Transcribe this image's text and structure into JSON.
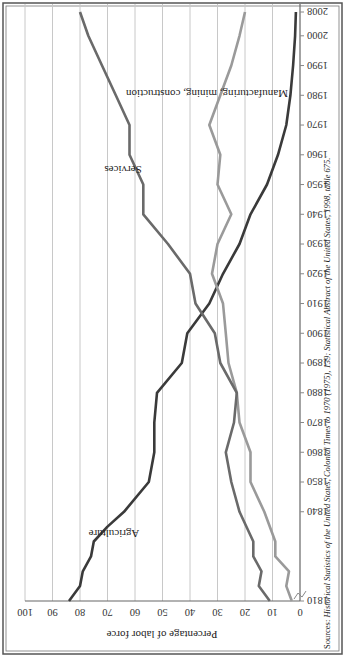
{
  "chart_data": {
    "type": "line",
    "title": "",
    "xlabel": "",
    "ylabel": "Percentage of labor force",
    "ylim": [
      0,
      100
    ],
    "grid": true,
    "y_ticks": [
      "0",
      "10",
      "20",
      "30",
      "40",
      "50",
      "60",
      "70",
      "80",
      "90",
      "100"
    ],
    "x_ticks": [
      "1810",
      "1840",
      "1850",
      "1860",
      "1870",
      "1880",
      "1890",
      "1900",
      "1910",
      "1920",
      "1930",
      "1940",
      "1950",
      "1960",
      "1970",
      "1980",
      "1990",
      "2000",
      "2008"
    ],
    "series": [
      {
        "name": "Agriculture",
        "color": "#3a3a3a",
        "x": [
          1810,
          1815,
          1820,
          1825,
          1830,
          1835,
          1840,
          1850,
          1860,
          1870,
          1880,
          1890,
          1900,
          1910,
          1920,
          1930,
          1940,
          1950,
          1960,
          1970,
          1980,
          1990,
          2000,
          2008
        ],
        "values": [
          84,
          80,
          79,
          76,
          75,
          70,
          64,
          55,
          53,
          53,
          52,
          43,
          41,
          33,
          28,
          22,
          18,
          12,
          8,
          5,
          3.5,
          2.5,
          1.8,
          1.5
        ]
      },
      {
        "name": "Manufacturing, mining, construction",
        "color": "#9a9a9a",
        "x": [
          1810,
          1815,
          1820,
          1825,
          1830,
          1840,
          1850,
          1860,
          1870,
          1880,
          1890,
          1900,
          1910,
          1920,
          1930,
          1940,
          1950,
          1960,
          1970,
          1980,
          1990,
          2000,
          2008
        ],
        "values": [
          3,
          5,
          4,
          9,
          9,
          13,
          18,
          18,
          22,
          23,
          26,
          27,
          28,
          32,
          30,
          25,
          30,
          29,
          33,
          29,
          25,
          22,
          20
        ]
      },
      {
        "name": "Services",
        "color": "#6a6a6a",
        "x": [
          1810,
          1815,
          1820,
          1825,
          1830,
          1840,
          1850,
          1860,
          1870,
          1880,
          1890,
          1900,
          1910,
          1920,
          1930,
          1940,
          1950,
          1960,
          1970,
          1980,
          1990,
          2000,
          2008
        ],
        "values": [
          11,
          15,
          14,
          17,
          17,
          22,
          25,
          27,
          24,
          23,
          29,
          31,
          38,
          40,
          48,
          57,
          57,
          62,
          62,
          67,
          72,
          77,
          80
        ]
      }
    ],
    "annotations": [
      {
        "text": "Agriculture",
        "near": "1845"
      },
      {
        "text": "Services",
        "near": "1965"
      },
      {
        "text": "Manufacturing, mining, construction",
        "near": "1960"
      }
    ],
    "source": "Sources: Historical Statistics of the United States, Colonial Times to 1970 (1975), 139; Statistical Abstract of the United States, 1998, table 675."
  },
  "labels": {
    "agriculture": "Agriculture",
    "services": "Services",
    "manufacturing": "Manufacturing, mining, construction",
    "ylabel": "Percentage of labor force",
    "source_prefix": "Sources: ",
    "source_body": "Historical Statistics of the United States, Colonial Times to 1970 (1975), 139; Statistical Abstract of the United States, 1998, table 675."
  }
}
